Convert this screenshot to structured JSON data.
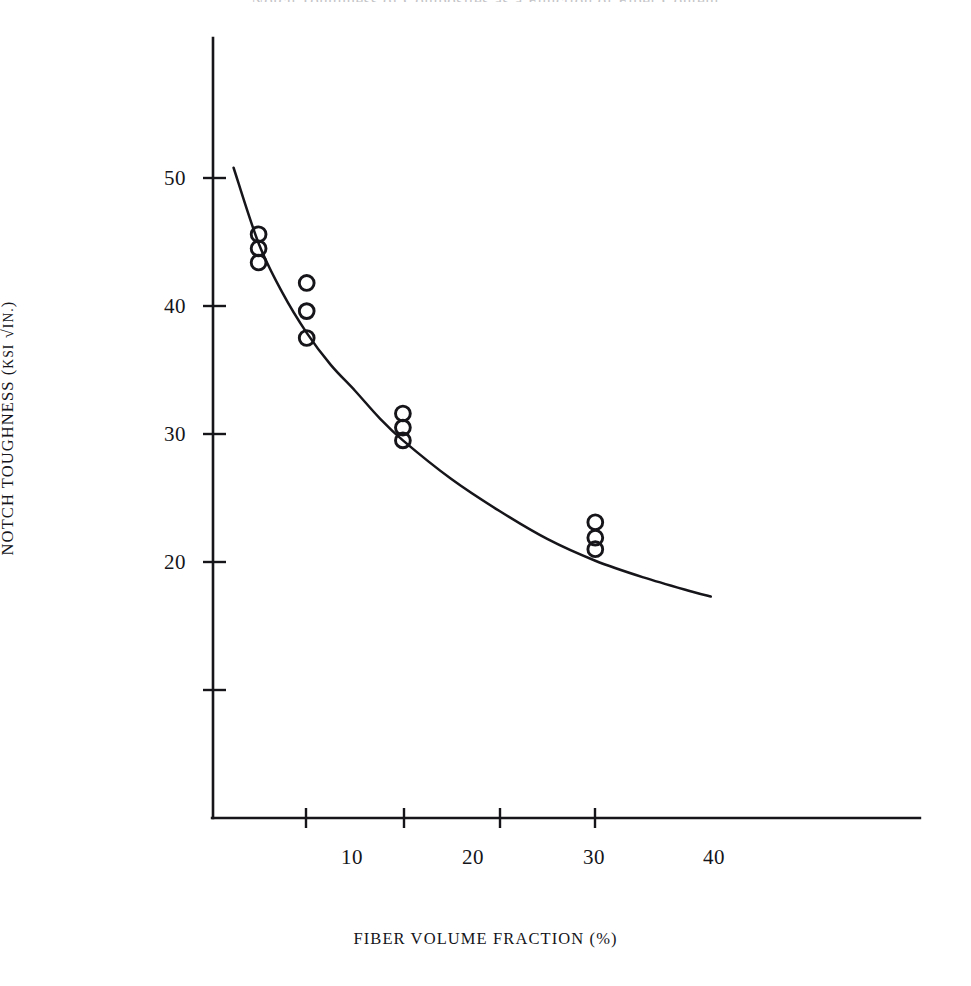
{
  "figure": {
    "top_caption": "Notch Toughness of Composites as a Function of Fiber Content",
    "background_color": "#ffffff",
    "ink_color": "#15151a"
  },
  "axes": {
    "y_title": "NOTCH TOUGHNESS (KSI √IN.)",
    "y_title_main": "NOTCH TOUGHNESS (",
    "y_title_unit": "KSI",
    "y_title_radicand": "IN.",
    "y_title_close": ")",
    "x_title": "FIBER VOLUME FRACTION (%)",
    "y_tick_labels": [
      "50",
      "40",
      "30",
      "20"
    ],
    "x_tick_labels": [
      "10",
      "20",
      "30",
      "40"
    ]
  },
  "chart_data": {
    "type": "scatter",
    "title": "Notch Toughness of Composites as a Function of Fiber Content",
    "xlabel": "FIBER VOLUME FRACTION (%)",
    "ylabel": "NOTCH TOUGHNESS (KSI √IN.)",
    "xlim": [
      0,
      74
    ],
    "ylim": [
      0,
      62
    ],
    "grid": false,
    "legend": null,
    "x_ticks": [
      10,
      20,
      30,
      40
    ],
    "y_ticks": [
      10,
      20,
      30,
      40,
      50
    ],
    "y_ticks_labeled": [
      20,
      30,
      40,
      50
    ],
    "marker": "open-circle",
    "series": [
      {
        "name": "measured notch toughness",
        "type": "scatter",
        "points": [
          {
            "x": 5,
            "y": 45.6
          },
          {
            "x": 5,
            "y": 44.5
          },
          {
            "x": 5,
            "y": 43.4
          },
          {
            "x": 10,
            "y": 41.8
          },
          {
            "x": 10,
            "y": 39.6
          },
          {
            "x": 10,
            "y": 37.5
          },
          {
            "x": 20,
            "y": 31.6
          },
          {
            "x": 20,
            "y": 30.5
          },
          {
            "x": 20,
            "y": 29.5
          },
          {
            "x": 40,
            "y": 23.1
          },
          {
            "x": 40,
            "y": 21.9
          },
          {
            "x": 40,
            "y": 21.0
          }
        ]
      },
      {
        "name": "fitted decay curve",
        "type": "line",
        "points": [
          {
            "x": 2.4,
            "y": 50.8
          },
          {
            "x": 5,
            "y": 44.9
          },
          {
            "x": 7.5,
            "y": 41.0
          },
          {
            "x": 10,
            "y": 37.9
          },
          {
            "x": 12.5,
            "y": 35.4
          },
          {
            "x": 15,
            "y": 33.4
          },
          {
            "x": 17.5,
            "y": 31.3
          },
          {
            "x": 20,
            "y": 29.5
          },
          {
            "x": 25,
            "y": 26.5
          },
          {
            "x": 30,
            "y": 24.0
          },
          {
            "x": 35,
            "y": 21.8
          },
          {
            "x": 40,
            "y": 20.1
          },
          {
            "x": 45,
            "y": 18.8
          },
          {
            "x": 50,
            "y": 17.7
          },
          {
            "x": 52,
            "y": 17.3
          }
        ]
      }
    ]
  }
}
